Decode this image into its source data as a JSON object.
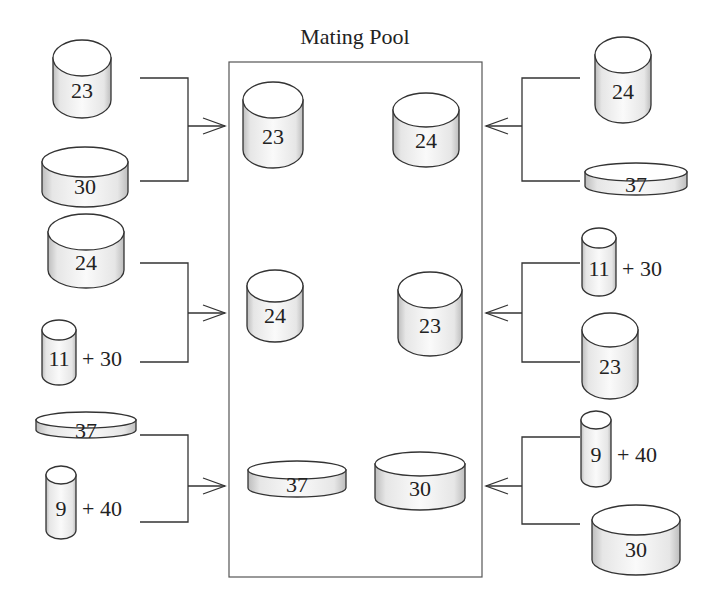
{
  "title": "Mating Pool",
  "colors": {
    "stroke": "#333333",
    "fill_top": "#ffffff",
    "fill_side_light": "#f4f4f4",
    "fill_side_dark": "#bdbdbd",
    "text": "#222222"
  },
  "left_groups": [
    {
      "parents": [
        {
          "label": "23",
          "extra": ""
        },
        {
          "label": "30",
          "extra": ""
        }
      ],
      "result": "23"
    },
    {
      "parents": [
        {
          "label": "24",
          "extra": ""
        },
        {
          "label": "11",
          "extra": "+ 30"
        }
      ],
      "result": "24"
    },
    {
      "parents": [
        {
          "label": "37",
          "extra": ""
        },
        {
          "label": "9",
          "extra": "+ 40"
        }
      ],
      "result": "37"
    }
  ],
  "right_groups": [
    {
      "parents": [
        {
          "label": "24",
          "extra": ""
        },
        {
          "label": "37",
          "extra": ""
        }
      ],
      "result": "24"
    },
    {
      "parents": [
        {
          "label": "11",
          "extra": "+ 30"
        },
        {
          "label": "23",
          "extra": ""
        }
      ],
      "result": "23"
    },
    {
      "parents": [
        {
          "label": "9",
          "extra": "+ 40"
        },
        {
          "label": "30",
          "extra": ""
        }
      ],
      "result": "30"
    }
  ]
}
